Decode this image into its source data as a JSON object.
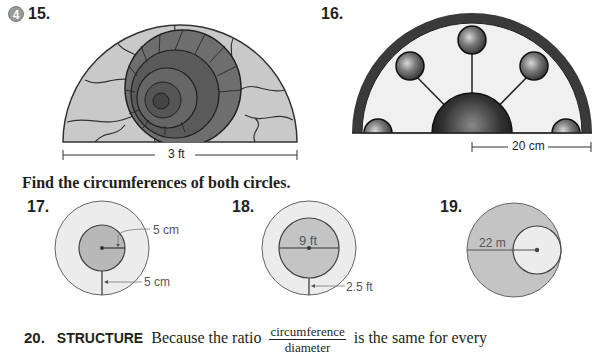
{
  "exercises": {
    "badge": "4",
    "ex15": {
      "number": "15.",
      "figure": "semicircular stained-glass window with ammonite shell",
      "dimension_label": "3 ft"
    },
    "ex16": {
      "number": "16.",
      "figure": "semicircular stained-glass window with marbled circles",
      "dimension_label": "20 cm"
    },
    "instruction": "Find the circumferences of both circles.",
    "ex17": {
      "number": "17.",
      "labels": [
        "5 cm",
        "5 cm"
      ]
    },
    "ex18": {
      "number": "18.",
      "labels": [
        "9 ft",
        "2.5 ft"
      ]
    },
    "ex19": {
      "number": "19.",
      "labels": [
        "22 m"
      ]
    },
    "ex20": {
      "number": "20.",
      "keyword": "STRUCTURE",
      "text_before": "Because the ratio",
      "fraction_numerator": "circumference",
      "fraction_denominator": "diameter",
      "text_after": "is the same for every"
    }
  },
  "colors": {
    "text": "#231f20",
    "badge": "#9a9a9a",
    "light_fill": "#e6e6e6",
    "mid_fill": "#b8b8b8",
    "line": "#555555"
  }
}
